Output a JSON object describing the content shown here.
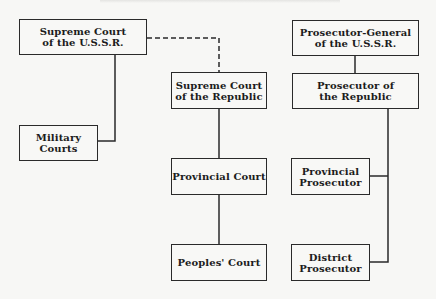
{
  "diagram": {
    "type": "org-chart",
    "nodes": {
      "supreme_court_ussr": {
        "line1": "Supreme Court",
        "line2": "of the U.S.S.R."
      },
      "military_courts": {
        "line1": "Military",
        "line2": "Courts"
      },
      "supreme_court_republic": {
        "line1": "Supreme Court",
        "line2": "of the Republic"
      },
      "provincial_court": {
        "line1": "Provincial Court"
      },
      "peoples_court": {
        "line1": "Peoples' Court"
      },
      "prosecutor_general_ussr": {
        "line1": "Prosecutor-General",
        "line2": "of the U.S.S.R."
      },
      "prosecutor_republic": {
        "line1": "Prosecutor of",
        "line2": "the Republic"
      },
      "provincial_prosecutor": {
        "line1": "Provincial",
        "line2": "Prosecutor"
      },
      "district_prosecutor": {
        "line1": "District",
        "line2": "Prosecutor"
      }
    },
    "edges": [
      {
        "from": "supreme_court_ussr",
        "to": "military_courts",
        "style": "solid"
      },
      {
        "from": "supreme_court_ussr",
        "to": "supreme_court_republic",
        "style": "dashed"
      },
      {
        "from": "supreme_court_republic",
        "to": "provincial_court",
        "style": "solid"
      },
      {
        "from": "provincial_court",
        "to": "peoples_court",
        "style": "solid"
      },
      {
        "from": "prosecutor_general_ussr",
        "to": "prosecutor_republic",
        "style": "solid"
      },
      {
        "from": "prosecutor_republic",
        "to": "provincial_prosecutor",
        "style": "solid"
      },
      {
        "from": "prosecutor_republic",
        "to": "district_prosecutor",
        "style": "solid"
      }
    ],
    "colors": {
      "line": "#2a2a2a",
      "background": "#f7f7f5"
    }
  }
}
